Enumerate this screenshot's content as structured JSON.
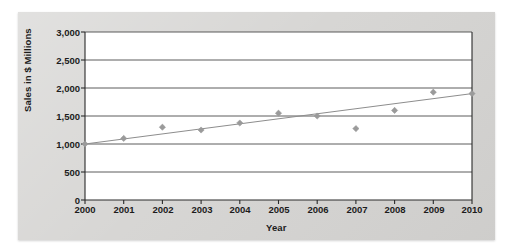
{
  "chart_data": {
    "type": "scatter",
    "title": "",
    "xlabel": "Year",
    "ylabel": "Sales in $ Millions",
    "xlim": [
      2000,
      2010
    ],
    "ylim": [
      0,
      3000
    ],
    "grid": true,
    "legend": false,
    "x_ticks": [
      "2000",
      "2001",
      "2002",
      "2003",
      "2004",
      "2005",
      "2006",
      "2007",
      "2008",
      "2009",
      "2010"
    ],
    "y_ticks": [
      "0",
      "500",
      "1,000",
      "1,500",
      "2,000",
      "2,500",
      "3,000"
    ],
    "categories": [
      2000,
      2001,
      2002,
      2003,
      2004,
      2005,
      2006,
      2007,
      2008,
      2009,
      2010
    ],
    "values": [
      1000,
      1100,
      1300,
      1250,
      1375,
      1550,
      1500,
      1275,
      1600,
      1925,
      1900
    ],
    "series": [
      {
        "name": "Sales",
        "marker": "diamond",
        "color": "#9a9a9a",
        "values": [
          1000,
          1100,
          1300,
          1250,
          1375,
          1550,
          1500,
          1275,
          1600,
          1925,
          1900
        ]
      },
      {
        "name": "Trend line",
        "type": "line",
        "color": "#8d8d8d",
        "endpoints": [
          {
            "x": 2000,
            "y": 1000
          },
          {
            "x": 2010,
            "y": 1900
          }
        ]
      }
    ],
    "annotations": [],
    "colors": {
      "panel": "#d5d4d2",
      "plot_background": "#ffffff",
      "gridline": "#4a4a4a",
      "axis": "#2a2a2a",
      "marker": "#9a9a9a",
      "trendline": "#8d8d8d",
      "text": "#1c1c1c"
    }
  }
}
